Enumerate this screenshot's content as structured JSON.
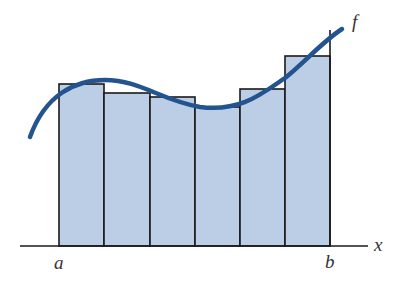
{
  "diagram": {
    "type": "riemann-sum",
    "labels": {
      "a": "a",
      "b": "b",
      "x_axis": "x",
      "function": "f"
    },
    "colors": {
      "bar_fill": "#bccde6",
      "bar_stroke": "#1a1a1a",
      "curve": "#23548f",
      "axis": "#1a1a1a"
    },
    "axis": {
      "y": 246,
      "x_start": 20,
      "x_end": 368
    },
    "bars": [
      {
        "x0": 59,
        "x1": 104,
        "top": 84
      },
      {
        "x0": 104,
        "x1": 150,
        "top": 93
      },
      {
        "x0": 150,
        "x1": 195,
        "top": 97
      },
      {
        "x0": 195,
        "x1": 240,
        "top": 107
      },
      {
        "x0": 240,
        "x1": 285,
        "top": 89
      },
      {
        "x0": 285,
        "x1": 330,
        "top": 56
      }
    ],
    "b_line": {
      "x": 330,
      "top": 30
    },
    "curve_path": "M 30 137 C 45 95, 75 80, 105 80 C 140 80, 160 100, 200 107 C 240 112, 260 95, 285 78 C 305 62, 322 42, 342 29"
  }
}
